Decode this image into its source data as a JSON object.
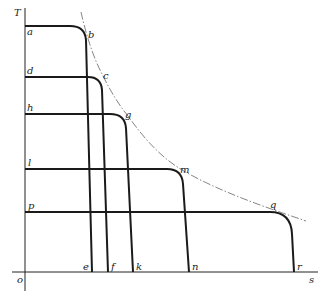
{
  "diagram": {
    "type": "T-s diagram",
    "axes": {
      "y_label": "T",
      "x_label": "s",
      "origin_label": "o"
    },
    "curves": [
      {
        "start_label": "a",
        "corner_label": "b",
        "end_label": "e"
      },
      {
        "start_label": "d",
        "corner_label": "c",
        "end_label": "f"
      },
      {
        "start_label": "h",
        "corner_label": "g",
        "end_label": "k"
      },
      {
        "start_label": "l",
        "corner_label": "m",
        "end_label": "n"
      },
      {
        "start_label": "p",
        "corner_label": "q",
        "end_label": "r"
      }
    ],
    "envelope": {
      "style": "dash-dot",
      "through": [
        "b",
        "c",
        "g",
        "m",
        "q"
      ]
    },
    "colors": {
      "line": "#1a1a1a",
      "envelope": "#666666",
      "background": "#ffffff"
    }
  }
}
